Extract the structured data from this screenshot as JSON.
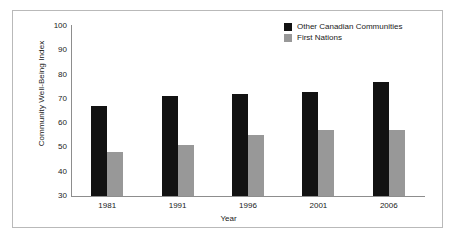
{
  "chart_data": {
    "type": "bar",
    "title": "",
    "subtitle": "",
    "xlabel": "Year",
    "ylabel": "Community Well-Being Index",
    "categories": [
      "1981",
      "1991",
      "1996",
      "2001",
      "2006"
    ],
    "series": [
      {
        "name": "Other Canadian Communities",
        "color": "#121212",
        "values": [
          67,
          71,
          72,
          73,
          77
        ]
      },
      {
        "name": "First Nations",
        "color": "#989898",
        "values": [
          48,
          51,
          55,
          57,
          57
        ]
      }
    ],
    "ylim": [
      30,
      100
    ],
    "ytick_labels": [
      "100",
      "90",
      "80",
      "70",
      "60",
      "50",
      "40",
      "30"
    ],
    "ytick_values": [
      100,
      90,
      80,
      70,
      60,
      50,
      40,
      30
    ],
    "grid": false,
    "legend_position": "top-right",
    "axis_color": "#8d8d8d",
    "frame_color": "#b9b9b9",
    "background_color": "#ffffff"
  }
}
